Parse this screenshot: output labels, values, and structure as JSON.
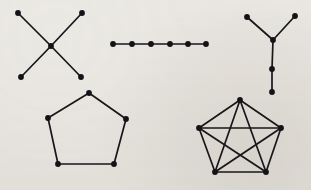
{
  "figure": {
    "background_color": "#edebe7",
    "ink_color": "#131216",
    "width": 311,
    "height": 190,
    "vertex_radius": 2.9,
    "edge_width": 1.7
  },
  "graphs": [
    {
      "id": "star-graph",
      "name": "four-pointed star graph",
      "label": "K1,4 star",
      "vertex_count": 5,
      "edge_count": 4,
      "vertices": [
        {
          "id": "s0",
          "x": 18,
          "y": 13
        },
        {
          "id": "s1",
          "x": 82,
          "y": 13
        },
        {
          "id": "s2",
          "x": 51,
          "y": 46
        },
        {
          "id": "s3",
          "x": 21,
          "y": 77
        },
        {
          "id": "s4",
          "x": 81,
          "y": 77
        }
      ],
      "edges": [
        {
          "from": "s0",
          "to": "s2"
        },
        {
          "from": "s1",
          "to": "s2"
        },
        {
          "from": "s2",
          "to": "s3"
        },
        {
          "from": "s2",
          "to": "s4"
        }
      ]
    },
    {
      "id": "path-graph",
      "name": "path graph",
      "label": "P6 path",
      "vertex_count": 6,
      "edge_count": 5,
      "vertices": [
        {
          "id": "p0",
          "x": 113,
          "y": 44
        },
        {
          "id": "p1",
          "x": 132,
          "y": 44
        },
        {
          "id": "p2",
          "x": 151,
          "y": 44
        },
        {
          "id": "p3",
          "x": 170,
          "y": 44
        },
        {
          "id": "p4",
          "x": 188,
          "y": 44
        },
        {
          "id": "p5",
          "x": 206,
          "y": 44
        }
      ],
      "edges": [
        {
          "from": "p0",
          "to": "p1"
        },
        {
          "from": "p1",
          "to": "p2"
        },
        {
          "from": "p2",
          "to": "p3"
        },
        {
          "from": "p3",
          "to": "p4"
        },
        {
          "from": "p4",
          "to": "p5"
        }
      ]
    },
    {
      "id": "tree-graph",
      "name": "Y-shaped tree graph",
      "label": "Y tree",
      "vertex_count": 5,
      "edge_count": 4,
      "vertices": [
        {
          "id": "t0",
          "x": 247,
          "y": 17
        },
        {
          "id": "t1",
          "x": 295,
          "y": 16
        },
        {
          "id": "t2",
          "x": 273,
          "y": 40
        },
        {
          "id": "t3",
          "x": 272,
          "y": 69
        },
        {
          "id": "t4",
          "x": 272,
          "y": 92
        }
      ],
      "edges": [
        {
          "from": "t0",
          "to": "t2"
        },
        {
          "from": "t1",
          "to": "t2"
        },
        {
          "from": "t2",
          "to": "t3"
        },
        {
          "from": "t3",
          "to": "t4"
        }
      ]
    },
    {
      "id": "pentagon-graph",
      "name": "pentagon cycle graph",
      "label": "C5 cycle",
      "vertex_count": 5,
      "edge_count": 5,
      "vertices": [
        {
          "id": "c0",
          "x": 89,
          "y": 93
        },
        {
          "id": "c1",
          "x": 126,
          "y": 119
        },
        {
          "id": "c2",
          "x": 114,
          "y": 164
        },
        {
          "id": "c3",
          "x": 58,
          "y": 164
        },
        {
          "id": "c4",
          "x": 48,
          "y": 118
        }
      ],
      "edges": [
        {
          "from": "c0",
          "to": "c1"
        },
        {
          "from": "c1",
          "to": "c2"
        },
        {
          "from": "c2",
          "to": "c3"
        },
        {
          "from": "c3",
          "to": "c4"
        },
        {
          "from": "c4",
          "to": "c0"
        }
      ]
    },
    {
      "id": "complete-graph",
      "name": "complete graph on five vertices",
      "label": "K5 complete",
      "vertex_count": 5,
      "edge_count": 10,
      "vertices": [
        {
          "id": "k0",
          "x": 240,
          "y": 100
        },
        {
          "id": "k1",
          "x": 281,
          "y": 128
        },
        {
          "id": "k2",
          "x": 266,
          "y": 172
        },
        {
          "id": "k3",
          "x": 215,
          "y": 172
        },
        {
          "id": "k4",
          "x": 199,
          "y": 128
        }
      ],
      "edges": [
        {
          "from": "k0",
          "to": "k1"
        },
        {
          "from": "k1",
          "to": "k2"
        },
        {
          "from": "k2",
          "to": "k3"
        },
        {
          "from": "k3",
          "to": "k4"
        },
        {
          "from": "k4",
          "to": "k0"
        },
        {
          "from": "k0",
          "to": "k2"
        },
        {
          "from": "k0",
          "to": "k3"
        },
        {
          "from": "k1",
          "to": "k3"
        },
        {
          "from": "k1",
          "to": "k4"
        },
        {
          "from": "k2",
          "to": "k4"
        }
      ]
    }
  ]
}
